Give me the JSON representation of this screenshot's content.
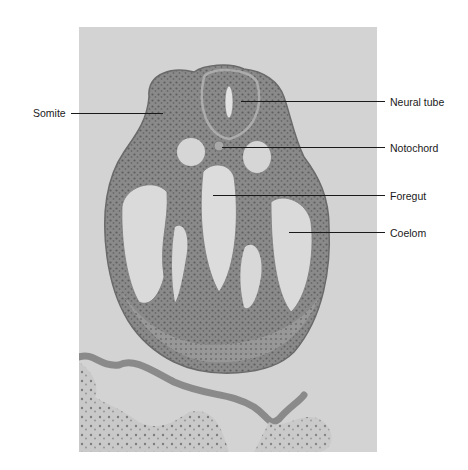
{
  "figure": {
    "type": "histology-micrograph",
    "background_color": "#ffffff",
    "photo_background_color": "#d3d3d3",
    "tissue_dark_color": "#6e6e6e",
    "tissue_mid_color": "#8f8f8f",
    "lumen_color": "#dcdcdc"
  },
  "labels": {
    "somite": "Somite",
    "neural_tube": "Neural tube",
    "notochord": "Notochord",
    "foregut": "Foregut",
    "coelom": "Coelom"
  }
}
